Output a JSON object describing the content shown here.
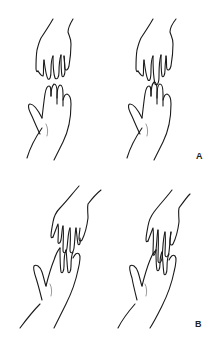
{
  "figure": {
    "panels": [
      {
        "id": "A",
        "label": "A",
        "description": "Two pairs of hands, vertical alignment: upper hand reaching down, lower hand reaching up, fingertips nearly touching (left) and overlapping (right)"
      },
      {
        "id": "B",
        "label": "B",
        "description": "Two pairs of hands, diagonal alignment: upper hand reaching down-left, lower hand reaching up-right, fingers interlacing (left) and overlapping (right)"
      }
    ],
    "colors": {
      "background": "#ffffff",
      "line": "#1a1a1a"
    }
  }
}
